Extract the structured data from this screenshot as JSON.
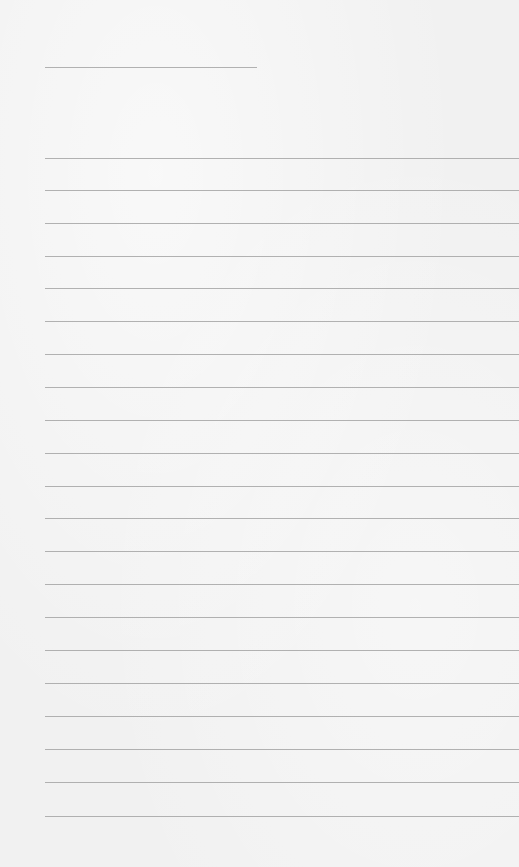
{
  "page": {
    "type": "lined-paper",
    "background_color": "#f1f1f1",
    "line_color": "#9a9a9a",
    "header_line": {
      "x1": 45,
      "x2": 257,
      "y": 67
    },
    "ruled_lines": {
      "x1": 45,
      "x2": 519,
      "y_positions": [
        158,
        190,
        223,
        256,
        288,
        321,
        354,
        387,
        420,
        453,
        486,
        518,
        551,
        584,
        617,
        650,
        683,
        716,
        749,
        782,
        816
      ]
    }
  }
}
